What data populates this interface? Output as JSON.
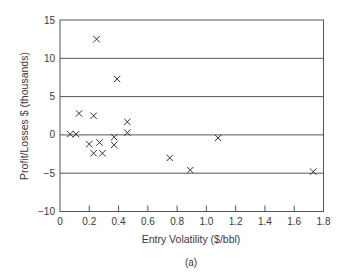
{
  "chart_data": {
    "type": "scatter",
    "title": "",
    "caption": "(a)",
    "xlabel": "Entry Volatility ($/bbl)",
    "ylabel": "Profit/Losses $ (thousands)",
    "xlim": [
      0,
      1.8
    ],
    "ylim": [
      -10,
      15
    ],
    "xticks": [
      0,
      0.2,
      0.4,
      0.6,
      0.8,
      1.0,
      1.2,
      1.4,
      1.6,
      1.8
    ],
    "xtick_labels": [
      "0",
      "0.2",
      "0.4",
      "0.6",
      "0.8",
      "1.0",
      "1.2",
      "1.4",
      "1.6",
      "1.8"
    ],
    "yticks": [
      -10,
      -5,
      0,
      5,
      10,
      15
    ],
    "ytick_labels": [
      "−10",
      "−5",
      "0",
      "5",
      "10",
      "15"
    ],
    "grid": "horizontal",
    "marker": "x",
    "series": [
      {
        "name": "trades",
        "points": [
          {
            "x": 0.07,
            "y": 0.1
          },
          {
            "x": 0.11,
            "y": 0.1
          },
          {
            "x": 0.13,
            "y": 2.8
          },
          {
            "x": 0.2,
            "y": -1.2
          },
          {
            "x": 0.23,
            "y": 2.5
          },
          {
            "x": 0.23,
            "y": -2.4
          },
          {
            "x": 0.25,
            "y": 12.5
          },
          {
            "x": 0.27,
            "y": -1.0
          },
          {
            "x": 0.29,
            "y": -2.4
          },
          {
            "x": 0.37,
            "y": -0.3
          },
          {
            "x": 0.37,
            "y": -1.3
          },
          {
            "x": 0.39,
            "y": 7.3
          },
          {
            "x": 0.46,
            "y": 1.7
          },
          {
            "x": 0.46,
            "y": 0.3
          },
          {
            "x": 0.75,
            "y": -3.0
          },
          {
            "x": 0.89,
            "y": -4.6
          },
          {
            "x": 1.08,
            "y": -0.4
          },
          {
            "x": 1.73,
            "y": -4.8
          }
        ]
      }
    ]
  }
}
